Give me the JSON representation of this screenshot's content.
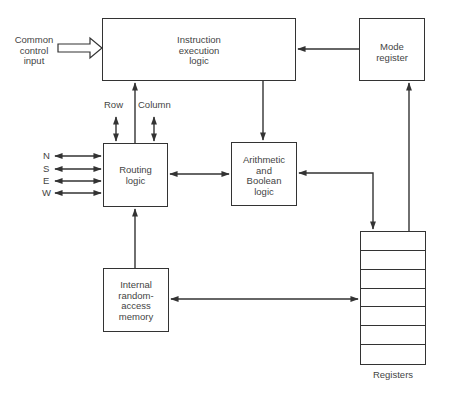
{
  "diagram": {
    "blocks": {
      "instruction": {
        "label": "Instruction\nexecution\nlogic"
      },
      "mode_register": {
        "label": "Mode\nregister"
      },
      "routing": {
        "label": "Routing\nlogic"
      },
      "arithmetic": {
        "label": "Arithmetic\nand\nBoolean\nlogic"
      },
      "ram": {
        "label": "Internal\nrandom-\naccess\nmemory"
      },
      "registers": {
        "label": "Registers",
        "rows": 7
      }
    },
    "labels": {
      "common_control_input": "Common\ncontrol\ninput",
      "row": "Row",
      "column": "Column",
      "directions": [
        "N",
        "S",
        "E",
        "W"
      ]
    },
    "edges": [
      {
        "from": "Common control input",
        "to": "Instruction execution logic",
        "style": "hollow-arrow"
      },
      {
        "from": "Mode register",
        "to": "Instruction execution logic"
      },
      {
        "from": "Instruction execution logic",
        "to": "Arithmetic and Boolean logic"
      },
      {
        "from": "Routing logic",
        "to": "Instruction execution logic"
      },
      {
        "from": "Row",
        "to": "Routing logic",
        "style": "bidirectional"
      },
      {
        "from": "Column",
        "to": "Routing logic",
        "style": "bidirectional"
      },
      {
        "from": "N/S/E/W",
        "to": "Routing logic",
        "style": "bidirectional"
      },
      {
        "from": "Routing logic",
        "to": "Arithmetic and Boolean logic",
        "style": "bidirectional"
      },
      {
        "from": "Arithmetic and Boolean logic",
        "to": "Registers",
        "style": "bidirectional"
      },
      {
        "from": "Internal random-access memory",
        "to": "Routing logic"
      },
      {
        "from": "Internal random-access memory",
        "to": "Registers",
        "style": "bidirectional"
      },
      {
        "from": "Registers",
        "to": "Mode register"
      }
    ]
  }
}
